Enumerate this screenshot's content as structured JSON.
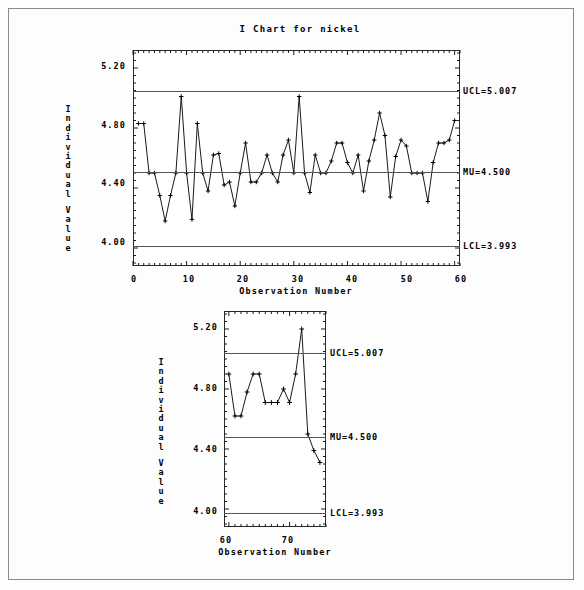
{
  "page": {
    "background": "#fdfdfd",
    "border_color": "#8a8a8a"
  },
  "charts": {
    "top": {
      "title": "I Chart for nickel",
      "xlabel": "Observation Number",
      "ylabel_chars": [
        "I",
        "n",
        "d",
        "i",
        "v",
        "i",
        "d",
        "u",
        "a",
        "l",
        "V",
        "a",
        "l",
        "u",
        "e"
      ],
      "ytick_labels": [
        "5.20",
        "4.80",
        "4.40",
        "4.00"
      ],
      "xtick_labels": [
        "0",
        "10",
        "20",
        "30",
        "40",
        "50",
        "60"
      ],
      "ucl_label": "UCL=5.007",
      "mu_label": "MU=4.500",
      "lcl_label": "LCL=3.993"
    },
    "bottom": {
      "xlabel": "Observation Number",
      "ylabel_chars": [
        "I",
        "n",
        "d",
        "i",
        "v",
        "i",
        "d",
        "u",
        "a",
        "l",
        "V",
        "a",
        "l",
        "u",
        "e"
      ],
      "ytick_labels": [
        "5.20",
        "4.80",
        "4.40",
        "4.00"
      ],
      "xtick_labels": [
        "60",
        "70"
      ],
      "ucl_label": "UCL=5.007",
      "mu_label": "MU=4.500",
      "lcl_label": "LCL=3.993"
    }
  },
  "chart_data": [
    {
      "type": "line",
      "id": "i-chart-top",
      "title": "I Chart for nickel",
      "xlabel": "Observation Number",
      "ylabel": "Individual Value",
      "xlim": [
        0,
        61
      ],
      "ylim": [
        3.88,
        5.32
      ],
      "yticks": [
        5.2,
        4.8,
        4.4,
        4.0
      ],
      "xticks": [
        0,
        10,
        20,
        30,
        40,
        50,
        60
      ],
      "grid": false,
      "legend": null,
      "control_limits": {
        "UCL": 5.007,
        "MU": 4.5,
        "LCL": 3.993
      },
      "annotations": [
        "UCL=5.007",
        "MU=4.500",
        "LCL=3.993"
      ],
      "x": [
        1,
        2,
        3,
        4,
        5,
        6,
        7,
        8,
        9,
        10,
        11,
        12,
        13,
        14,
        15,
        16,
        17,
        18,
        19,
        20,
        21,
        22,
        23,
        24,
        25,
        26,
        27,
        28,
        29,
        30,
        31,
        32,
        33,
        34,
        35,
        36,
        37,
        38,
        39,
        40,
        41,
        42,
        43,
        44,
        45,
        46,
        47,
        48,
        49,
        50,
        51,
        52,
        53,
        54,
        55,
        56,
        57,
        58,
        59,
        60
      ],
      "values": [
        4.83,
        4.83,
        4.5,
        4.5,
        4.35,
        4.18,
        4.35,
        4.5,
        5.01,
        4.5,
        4.19,
        4.83,
        4.5,
        4.38,
        4.62,
        4.63,
        4.42,
        4.44,
        4.28,
        4.5,
        4.7,
        4.44,
        4.44,
        4.5,
        4.62,
        4.5,
        4.44,
        4.62,
        4.72,
        4.5,
        5.01,
        4.5,
        4.37,
        4.62,
        4.5,
        4.5,
        4.58,
        4.7,
        4.7,
        4.57,
        4.5,
        4.62,
        4.38,
        4.58,
        4.72,
        4.9,
        4.75,
        4.34,
        4.61,
        4.72,
        4.68,
        4.5,
        4.5,
        4.5,
        4.31,
        4.57,
        4.7,
        4.7,
        4.72,
        4.85
      ]
    },
    {
      "type": "line",
      "id": "i-chart-bottom",
      "title": "",
      "xlabel": "Observation Number",
      "ylabel": "Individual Value",
      "xlim": [
        59.2,
        76
      ],
      "ylim": [
        3.88,
        5.32
      ],
      "yticks": [
        5.2,
        4.8,
        4.4,
        4.0
      ],
      "xticks": [
        60,
        70
      ],
      "grid": false,
      "legend": null,
      "control_limits": {
        "UCL": 5.007,
        "MU": 4.5,
        "LCL": 3.993
      },
      "annotations": [
        "UCL=5.007",
        "MU=4.500",
        "LCL=3.993"
      ],
      "x": [
        60,
        61,
        62,
        63,
        64,
        65,
        66,
        67,
        68,
        69,
        70,
        71,
        72,
        73,
        74,
        75
      ],
      "values": [
        4.9,
        4.62,
        4.62,
        4.78,
        4.9,
        4.9,
        4.71,
        4.71,
        4.71,
        4.8,
        4.71,
        4.9,
        5.2,
        4.5,
        4.39,
        4.31
      ]
    }
  ]
}
